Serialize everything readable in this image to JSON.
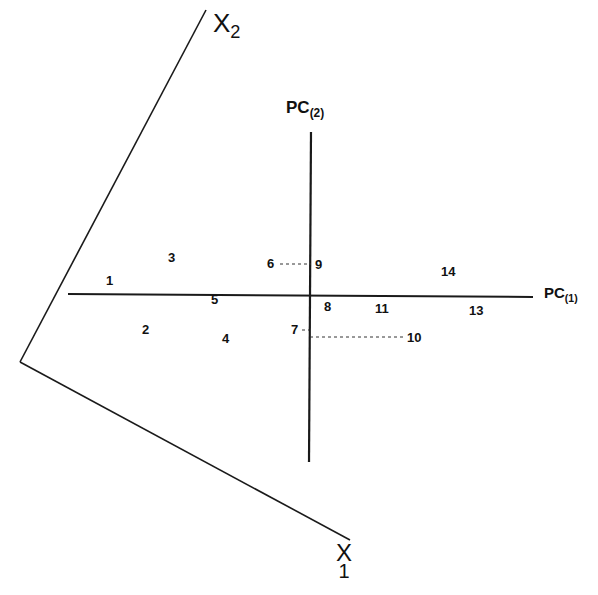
{
  "diagram": {
    "original_axes": {
      "x1": {
        "label": "X",
        "subscript": "1"
      },
      "x2": {
        "label": "X",
        "subscript": "2"
      }
    },
    "pc_axes": {
      "pc1": {
        "label": "PC",
        "subscript": "(1)"
      },
      "pc2": {
        "label": "PC",
        "subscript": "(2)"
      }
    },
    "points": [
      {
        "id": "1",
        "x": 110,
        "y": 281
      },
      {
        "id": "2",
        "x": 146,
        "y": 330
      },
      {
        "id": "3",
        "x": 172,
        "y": 258
      },
      {
        "id": "4",
        "x": 226,
        "y": 339
      },
      {
        "id": "5",
        "x": 215,
        "y": 300
      },
      {
        "id": "6",
        "x": 271,
        "y": 264
      },
      {
        "id": "7",
        "x": 295,
        "y": 330
      },
      {
        "id": "8",
        "x": 328,
        "y": 307
      },
      {
        "id": "9",
        "x": 319,
        "y": 265
      },
      {
        "id": "10",
        "x": 415,
        "y": 338
      },
      {
        "id": "11",
        "x": 383,
        "y": 309
      },
      {
        "id": "13",
        "x": 477,
        "y": 311
      },
      {
        "id": "14",
        "x": 449,
        "y": 272
      }
    ],
    "colors": {
      "line": "#1a1a1a",
      "text": "#111111",
      "background": "#ffffff"
    }
  }
}
